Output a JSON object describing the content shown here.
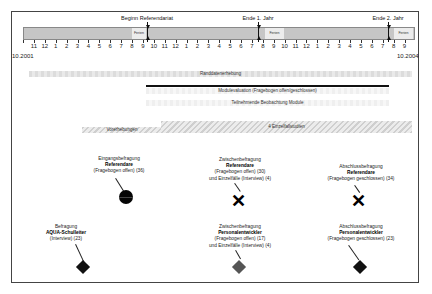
{
  "timeline": {
    "start_label": "10.2001",
    "end_label": "10.2004",
    "month_ticks": [
      "11",
      "12",
      "1",
      "2",
      "3",
      "4",
      "5",
      "6",
      "7",
      "8",
      "9",
      "10",
      "11",
      "12",
      "1",
      "2",
      "3",
      "4",
      "5",
      "6",
      "7",
      "8",
      "9",
      "10",
      "11",
      "12",
      "1",
      "2",
      "3",
      "4",
      "5",
      "6",
      "7",
      "8",
      "9"
    ],
    "ferien_label": "Ferien",
    "markers": [
      {
        "label": "Beginn Referendariat"
      },
      {
        "label": "Ende 1. Jahr"
      },
      {
        "label": "Ende 2. Jahr"
      }
    ]
  },
  "activities": {
    "randdaten": "Randdatenerhebung",
    "modulevaluation": "Modulevaluation (Fragebogen offen/geschlossen)",
    "beobachtung": "Teilnehmende Beobachtung Module",
    "vorerhebungen": "Vorerhebungen",
    "einzelfall": "4 Einzelfallstudien"
  },
  "surveys": {
    "eingang_ref": {
      "title": "Eingangsbefragung",
      "group": "Referendare",
      "detail1": "(Fragebogen offen) (36)",
      "detail2": ""
    },
    "zwischen_ref": {
      "title": "Zwischenbefragung",
      "group": "Referendare",
      "detail1": "(Fragebogen offen) (30)",
      "detail2": "und Einzelfälle (Interview) (4)"
    },
    "abschluss_ref": {
      "title": "Abschlussbefragung",
      "group": "Referendare",
      "detail1": "(Fragebogen geschlossen) (34)",
      "detail2": ""
    },
    "aqua": {
      "title": "Befragung",
      "group": "AQUA-Schulleiter",
      "detail1": "(Interview) (23)",
      "detail2": ""
    },
    "zwischen_pe": {
      "title": "Zwischenbefragung",
      "group": "Personalentwickler",
      "detail1": "(Fragebogen offen) (17)",
      "detail2": "und Einzelfälle (Interview) (4)"
    },
    "abschluss_pe": {
      "title": "Abschlussbefragung",
      "group": "Personalentwickler",
      "detail1": "(Fragebogen geschlossen)  (23)",
      "detail2": ""
    }
  },
  "symbols": {
    "xmark": "✕"
  },
  "colors": {
    "timeline_bar": "#c6c6c6",
    "ferien": "#ececec",
    "marker_black": "#111111",
    "diamond_grey": "#555555"
  }
}
